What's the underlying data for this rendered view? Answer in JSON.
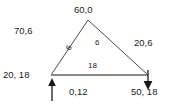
{
  "diagram": {
    "type": "triangle-force-diagram",
    "background_color": "#ffffff",
    "line_color": "#4a4a4a",
    "base_line_color": "#808080",
    "text_color": "#1a1a1a",
    "vertices": {
      "apex": {
        "x": 88,
        "y": 20
      },
      "bottom_left": {
        "x": 51,
        "y": 75
      },
      "bottom_right": {
        "x": 148,
        "y": 75
      }
    },
    "arrows": [
      {
        "name": "support-arrow-left",
        "direction": "up",
        "x": 52,
        "y_start": 101,
        "y_end": 79
      },
      {
        "name": "load-arrow-right",
        "direction": "down",
        "x": 148,
        "y_start": 71,
        "y_end": 89
      }
    ],
    "labels": {
      "apex": "60,0",
      "upper_left": "70,6",
      "right": "20,6",
      "lower_left": "20, 18",
      "bottom_center": "0,12",
      "bottom_right": "50, 18",
      "left_edge": "6",
      "interior": "6",
      "base_edge": "18"
    }
  }
}
